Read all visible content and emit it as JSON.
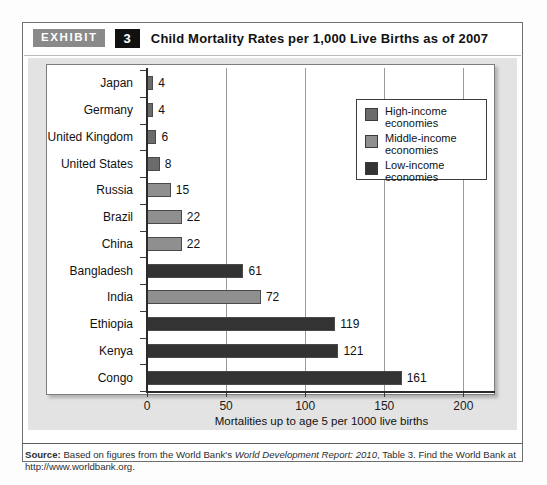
{
  "exhibit": {
    "badge_label": "EXHIBIT",
    "number": "3",
    "title": "Child Mortality Rates per 1,000 Live Births as of 2007"
  },
  "legend": {
    "items": [
      {
        "label_line1": "High-income",
        "label_line2": "economies",
        "color": "#6b6b6b"
      },
      {
        "label_line1": "Middle-income",
        "label_line2": "economies",
        "color": "#8f8f8f"
      },
      {
        "label_line1": "Low-income",
        "label_line2": "economies",
        "color": "#333333"
      }
    ]
  },
  "source": {
    "prefix": "Source:",
    "text_before_italic": " Based on figures from the World Bank's ",
    "italic_title": "World Development Report: 2010",
    "text_after_italic": ", Table 3. Find the World Bank at",
    "url": "http://www.worldbank.org."
  },
  "chart_data": {
    "type": "bar",
    "orientation": "horizontal",
    "title": "Child Mortality Rates per 1,000 Live Births as of 2007",
    "xlabel": "Mortalities up to age 5 per 1000 live births",
    "ylabel": "",
    "xlim": [
      0,
      220
    ],
    "xticks": [
      0,
      50,
      100,
      150,
      200
    ],
    "grid": true,
    "legend_position": "top-right",
    "categories": [
      "Japan",
      "Germany",
      "United Kingdom",
      "United States",
      "Russia",
      "Brazil",
      "China",
      "Bangladesh",
      "India",
      "Ethiopia",
      "Kenya",
      "Congo"
    ],
    "values": [
      4,
      4,
      6,
      8,
      15,
      22,
      22,
      61,
      72,
      119,
      121,
      161
    ],
    "groups": [
      "High-income economies",
      "High-income economies",
      "High-income economies",
      "High-income economies",
      "Middle-income economies",
      "Middle-income economies",
      "Middle-income economies",
      "Low-income economies",
      "Middle-income economies",
      "Low-income economies",
      "Low-income economies",
      "Low-income economies"
    ],
    "group_colors": {
      "High-income economies": "#6b6b6b",
      "Middle-income economies": "#8f8f8f",
      "Low-income economies": "#333333"
    }
  }
}
